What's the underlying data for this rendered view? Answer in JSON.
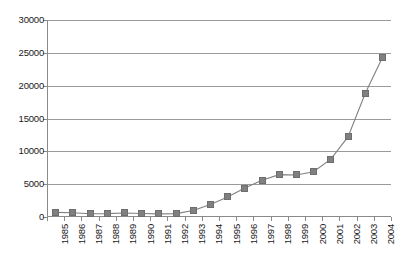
{
  "chart_data": {
    "type": "line",
    "title": "",
    "subtitle": "",
    "xlabel": "",
    "ylabel": "",
    "categories": [
      "1985",
      "1986",
      "1987",
      "1988",
      "1989",
      "1990",
      "1991",
      "1992",
      "1993",
      "1994",
      "1995",
      "1996",
      "1997",
      "1998",
      "1999",
      "2000",
      "2001",
      "2002",
      "2003",
      "2004"
    ],
    "values": [
      700,
      650,
      500,
      520,
      620,
      540,
      480,
      520,
      1000,
      1900,
      3050,
      4400,
      5600,
      6450,
      6400,
      6900,
      8800,
      12200,
      18800,
      24300
    ],
    "series": [
      {
        "name": "series-1",
        "marker": "square",
        "marker_color": "#808080",
        "line_color": "#808080",
        "values": [
          700,
          650,
          500,
          520,
          620,
          540,
          480,
          520,
          1000,
          1900,
          3050,
          4400,
          5600,
          6450,
          6400,
          6900,
          8800,
          12200,
          18800,
          24300
        ]
      }
    ],
    "ylim": [
      0,
      30000
    ],
    "yticks": [
      0,
      5000,
      10000,
      15000,
      20000,
      25000,
      30000
    ],
    "ytick_labels": [
      "0",
      "5000",
      "10000",
      "15000",
      "20000",
      "25000",
      "30000"
    ],
    "xtick_labels_rotation": -90,
    "grid": "horizontal",
    "legend": "none",
    "background": "#ffffff",
    "axis_color": "#8a8a8a",
    "gridline_color": "#9a9a9a"
  }
}
